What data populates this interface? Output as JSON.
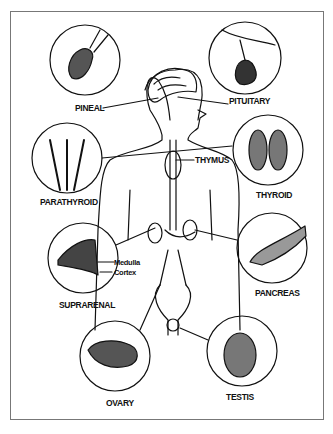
{
  "diagram": {
    "labels": {
      "pineal": "PINEAL",
      "pituitary": "PITUITARY",
      "thymus": "THYMUS",
      "thyroid": "THYROID",
      "parathyroid": "PARATHYROID",
      "suprarenal": "SUPRARENAL",
      "medulla": "Medulla",
      "cortex": "Cortex",
      "pancreas": "PANCREAS",
      "ovary": "OVARY",
      "testis": "TESTIS"
    }
  }
}
